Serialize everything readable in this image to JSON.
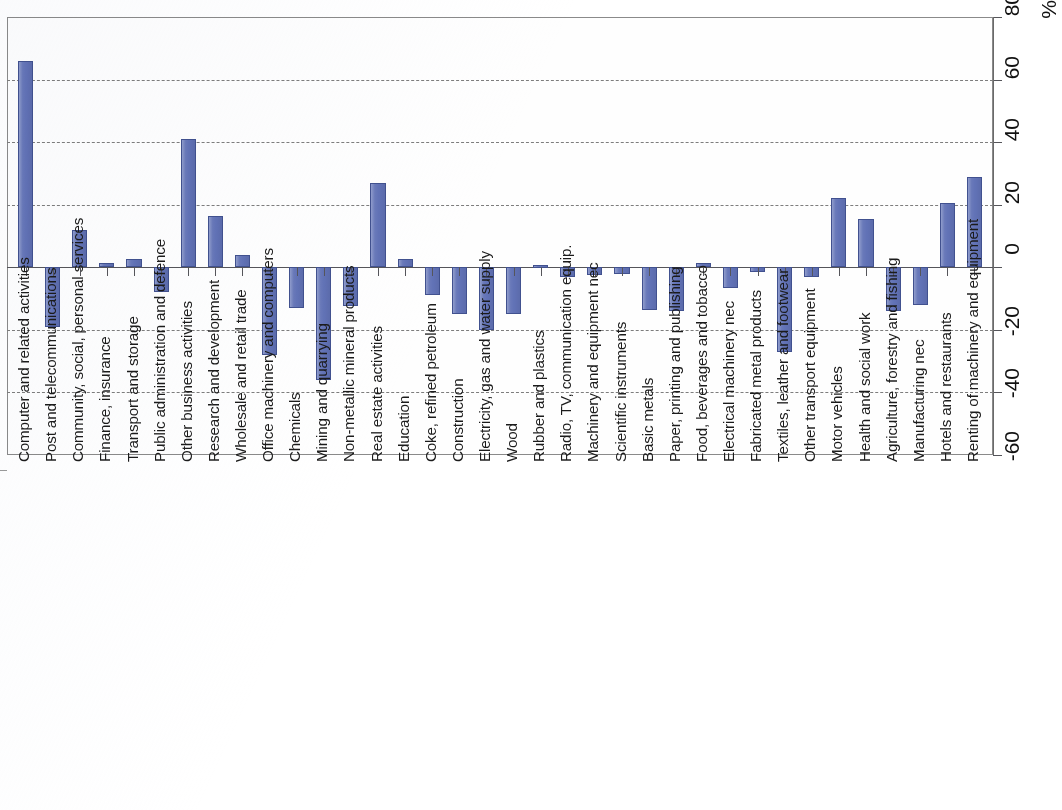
{
  "chart_data": {
    "type": "bar",
    "title": "",
    "subtitle": "",
    "xlabel": "",
    "ylabel": "%",
    "ylim": [
      -60,
      80
    ],
    "ytick_step": 20,
    "yticks": [
      -60,
      -40,
      -20,
      0,
      20,
      40,
      60,
      80
    ],
    "ytick_labels": [
      "-60",
      "-40",
      "-20",
      "0",
      "20",
      "40",
      "60",
      "80"
    ],
    "unit_label": "%",
    "grid": true,
    "grid_style": "dashed-horizontal",
    "axis_position": "right",
    "legend": null,
    "legend_position": "none",
    "orientation": "vertical",
    "bar_color": "#6172B6",
    "bar_edge_color": "#41518F",
    "categories": [
      "Computer and related activities",
      "Post and telecommunications",
      "Community, social, personal services",
      "Finance, insurance",
      "Transport and storage",
      "Public administration and defence",
      "Other business activities",
      "Research and development",
      "Wholesale and retail trade",
      "Office machinery and computers",
      "Chemicals",
      "Mining and quarrying",
      "Non-metallic mineral products",
      "Real estate activities",
      "Education",
      "Coke, refined petroleum",
      "Construction",
      "Electricity, gas and water supply",
      "Wood",
      "Rubber and plastics",
      "Radio, TV, communication equip.",
      "Machinery and equipment nec",
      "Scientific instruments",
      "Basic metals",
      "Paper, printing and publishing",
      "Food, beverages and tobacco",
      "Electrical machinery nec",
      "Fabricated metal products",
      "Textiles, leather and footwear",
      "Other transport equipment",
      "Motor vehicles",
      "Health and social work",
      "Agriculture, forestry and fishing",
      "Manufacturing nec",
      "Hotels and restaurants",
      "Renting of machinery and equipment"
    ],
    "values": [
      66,
      -19,
      12,
      1.5,
      2.5,
      -8,
      41,
      16.5,
      4,
      -28,
      -13,
      -36,
      -12.5,
      27,
      2.5,
      -9,
      -15,
      -20,
      -15,
      0.8,
      -3,
      -2.5,
      -2,
      -13.5,
      -14,
      1.5,
      -6.5,
      -1.5,
      -27,
      -3,
      22,
      15.5,
      -14,
      -12,
      20.5,
      29
    ]
  }
}
